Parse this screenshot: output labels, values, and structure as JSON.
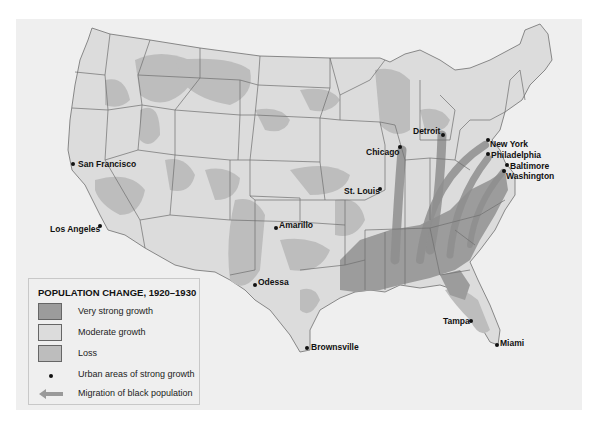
{
  "colors": {
    "very_strong_growth": "#9c9c9c",
    "moderate_growth": "#dcdcdc",
    "loss": "#bdbdbd",
    "migration_arrow": "#8e8e8e",
    "border": "#6e6e6e",
    "background": "#efefef"
  },
  "legend": {
    "title": "POPULATION CHANGE, 1920–1930",
    "items": [
      {
        "label": "Very strong growth",
        "symbol": "swatch-dark"
      },
      {
        "label": "Moderate growth",
        "symbol": "swatch-light"
      },
      {
        "label": "Loss",
        "symbol": "swatch-medium"
      },
      {
        "label": "Urban areas of strong growth",
        "symbol": "dot"
      },
      {
        "label": "Migration of black population",
        "symbol": "arrow"
      }
    ]
  },
  "cities": [
    {
      "name": "San Francisco",
      "x": 73,
      "y": 164
    },
    {
      "name": "Los Angeles",
      "x": 100,
      "y": 226
    },
    {
      "name": "Amarillo",
      "x": 276,
      "y": 228
    },
    {
      "name": "Odessa",
      "x": 254,
      "y": 283
    },
    {
      "name": "Brownsville",
      "x": 307,
      "y": 348
    },
    {
      "name": "Chicago",
      "x": 400,
      "y": 146
    },
    {
      "name": "St. Louis",
      "x": 380,
      "y": 189
    },
    {
      "name": "Detroit",
      "x": 442,
      "y": 134
    },
    {
      "name": "New York",
      "x": 487,
      "y": 140
    },
    {
      "name": "Philadelphia",
      "x": 488,
      "y": 153
    },
    {
      "name": "Baltimore",
      "x": 506,
      "y": 165
    },
    {
      "name": "Washington",
      "x": 503,
      "y": 171
    },
    {
      "name": "Tampa",
      "x": 470,
      "y": 320
    },
    {
      "name": "Miami",
      "x": 497,
      "y": 344
    }
  ]
}
